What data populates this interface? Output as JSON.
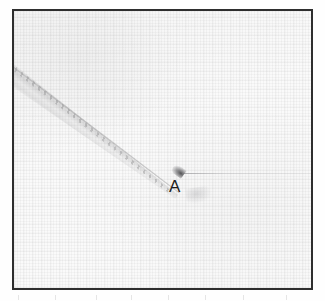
{
  "figure": {
    "type": "photomicrograph",
    "background_color": "#fafafa",
    "frame_color": "#2e2e2e",
    "annotations": [
      {
        "label": "A",
        "name": "point-label-a",
        "color": "#1d1d1d",
        "describes": "tip of the serrated object",
        "x": 156,
        "y": 170
      }
    ],
    "features": {
      "object_name": "serrated-diagonal-object",
      "object_color": "#8c8c8e",
      "object_angle_deg": 36.5,
      "tip_name": "object-tip",
      "tip_color": "#37373a",
      "tip_x": 168,
      "tip_y": 162,
      "horizontal_line_name": "faint-horizontal-line",
      "horizontal_line_color": "#787880",
      "smudge_name": "faint-smudge"
    },
    "frame": {
      "left": 12,
      "top": 9,
      "width": 301,
      "height": 281
    }
  }
}
